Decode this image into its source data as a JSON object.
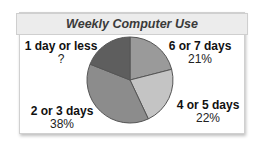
{
  "chart_data": {
    "type": "pie",
    "title": "Weekly Computer Use",
    "categories": [
      "6 or 7 days",
      "4 or 5 days",
      "2 or 3 days",
      "1 day or less"
    ],
    "values": [
      21,
      22,
      38,
      19
    ],
    "display_values": [
      "21%",
      "22%",
      "38%",
      "?"
    ],
    "colors": [
      "#9a9a9a",
      "#c4c4c4",
      "#8c8c8c",
      "#5e5e5e"
    ],
    "start_angle": "12 o'clock, clockwise",
    "legend": "none (direct labels)"
  },
  "labels": {
    "six_seven": {
      "name": "6 or 7 days",
      "value": "21%"
    },
    "four_five": {
      "name": "4 or 5 days",
      "value": "22%"
    },
    "two_three": {
      "name": "2 or 3 days",
      "value": "38%"
    },
    "one_less": {
      "name": "1 day or less",
      "value": "?"
    }
  }
}
